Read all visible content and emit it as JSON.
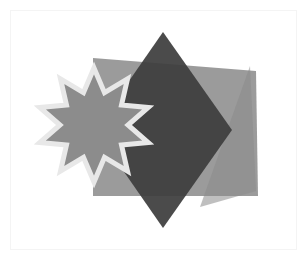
{
  "canvas": {
    "width": 307,
    "height": 260,
    "background_color": "#ffffff",
    "frame": {
      "label": "inner frame",
      "x": 10,
      "y": 10,
      "width": 287,
      "height": 240,
      "stroke_color": "#f4f4f4",
      "fill_color": "#ffffff"
    }
  },
  "shapes": [
    {
      "id": "quadrilateral",
      "label": "rotated quadrilateral",
      "kind": "polygon",
      "points": "93,58 256,71 258,196 93,196",
      "fill_color": "#8a8a8a",
      "opacity": 0.85,
      "stroke": "none"
    },
    {
      "id": "triangle",
      "label": "overlapping triangle",
      "kind": "polygon",
      "points": "250,66 256,191 200,207",
      "fill_color": "#8a8a8a",
      "opacity": 0.55,
      "stroke": "none"
    },
    {
      "id": "diamond",
      "label": "dark diamond square",
      "kind": "polygon",
      "points": "163,32 232,130 163,228 95,130",
      "fill_color": "#3d3d3d",
      "opacity": 0.93,
      "stroke": "none"
    },
    {
      "id": "star",
      "label": "ten point star",
      "kind": "star",
      "center_x": 94,
      "center_y": 125,
      "points_count": 10,
      "outer_radius": 57,
      "inner_radius": 34,
      "rotation_deg": -90,
      "fill_color": "#8c8c8c",
      "stroke_color": "#e8e8e8",
      "stroke_width": 5,
      "opacity": 1
    }
  ]
}
